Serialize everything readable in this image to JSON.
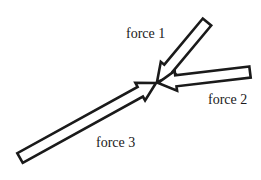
{
  "diagram": {
    "title": "",
    "background": "#ffffff",
    "stroke_color": "#1a1a1a",
    "convergence_point": {
      "x": 157,
      "y": 83
    },
    "forces": [
      {
        "id": "force1",
        "label": "force 1",
        "tail": {
          "x": 207,
          "y": 22
        },
        "tip": {
          "x": 157,
          "y": 82
        },
        "label_pos": {
          "x": 126,
          "y": 38
        }
      },
      {
        "id": "force2",
        "label": "force 2",
        "tail": {
          "x": 250,
          "y": 72
        },
        "tip": {
          "x": 158,
          "y": 83
        },
        "label_pos": {
          "x": 208,
          "y": 104
        }
      },
      {
        "id": "force3",
        "label": "force 3",
        "tail": {
          "x": 20,
          "y": 158
        },
        "tip": {
          "x": 156,
          "y": 83
        },
        "label_pos": {
          "x": 96,
          "y": 147
        }
      }
    ]
  }
}
